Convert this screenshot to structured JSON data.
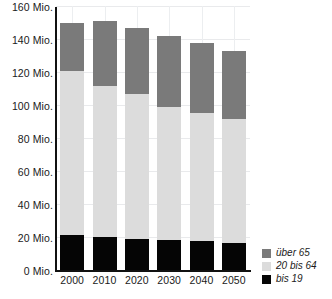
{
  "chart_data": {
    "type": "bar",
    "stacked": true,
    "title": "",
    "xlabel": "",
    "ylabel": "",
    "categories": [
      "2000",
      "2010",
      "2020",
      "2030",
      "2040",
      "2050"
    ],
    "ylim": [
      0,
      160
    ],
    "yticks": [
      0,
      20,
      40,
      60,
      80,
      100,
      120,
      140,
      160
    ],
    "ytick_labels": [
      "0 Mio.",
      "20 Mio.",
      "40 Mio.",
      "60 Mio.",
      "80 Mio.",
      "100 Mio.",
      "120 Mio.",
      "140 Mio.",
      "160 Mio."
    ],
    "unit": "Mio.",
    "grid": true,
    "legend_position": "bottom-right",
    "series": [
      {
        "name": "bis 19",
        "color": "#050505",
        "values": [
          21.0,
          19.8,
          18.5,
          17.9,
          17.3,
          16.1
        ]
      },
      {
        "name": "20 bis 64",
        "color": "#dcdcdc",
        "values": [
          99.4,
          92.0,
          88.4,
          80.9,
          77.8,
          75.3
        ]
      },
      {
        "name": "über 65",
        "color": "#7a7a7a",
        "values": [
          29.1,
          38.9,
          39.5,
          43.3,
          42.7,
          41.4
        ]
      }
    ],
    "totals": [
      149.5,
      150.7,
      146.4,
      142.1,
      137.8,
      132.8
    ]
  },
  "legend": {
    "items": [
      {
        "label": "über 65",
        "color": "#7a7a7a"
      },
      {
        "label": "20 bis 64",
        "color": "#dcdcdc"
      },
      {
        "label": "bis 19",
        "color": "#050505"
      }
    ]
  }
}
